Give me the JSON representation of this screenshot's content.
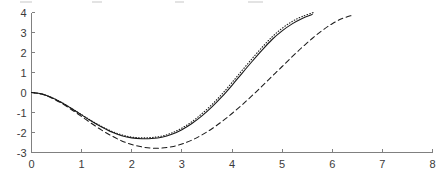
{
  "chart_data": {
    "type": "line",
    "title": "",
    "xlabel": "",
    "ylabel": "",
    "xlim": [
      0,
      8
    ],
    "ylim": [
      -3,
      4
    ],
    "xticks": [
      "0",
      "1",
      "2",
      "3",
      "4",
      "5",
      "6",
      "7",
      "8"
    ],
    "yticks": [
      "-3",
      "-2",
      "-1",
      "0",
      "1",
      "2",
      "3",
      "4"
    ],
    "grid": false,
    "legend": "none",
    "axis_color": "#808080",
    "line_color": "#1a1a1a",
    "series": [
      {
        "name": "solid",
        "style": "solid",
        "x": [
          0.0,
          0.2,
          0.4,
          0.6,
          0.8,
          1.0,
          1.2,
          1.4,
          1.6,
          1.8,
          2.0,
          2.2,
          2.4,
          2.6,
          2.8,
          3.0,
          3.2,
          3.4,
          3.6,
          3.8,
          4.0,
          4.2,
          4.4,
          4.6,
          4.8,
          5.0,
          5.2,
          5.4,
          5.6
        ],
        "y": [
          0.0,
          -0.07,
          -0.25,
          -0.5,
          -0.8,
          -1.12,
          -1.44,
          -1.73,
          -1.98,
          -2.16,
          -2.27,
          -2.31,
          -2.3,
          -2.24,
          -2.09,
          -1.86,
          -1.55,
          -1.17,
          -0.72,
          -0.21,
          0.36,
          0.96,
          1.55,
          2.12,
          2.65,
          3.08,
          3.43,
          3.7,
          3.9
        ]
      },
      {
        "name": "dotted",
        "style": "dotted",
        "x": [
          0.0,
          0.2,
          0.4,
          0.6,
          0.8,
          1.0,
          1.2,
          1.4,
          1.6,
          1.8,
          2.0,
          2.2,
          2.4,
          2.6,
          2.8,
          3.0,
          3.2,
          3.4,
          3.6,
          3.8,
          4.0,
          4.2,
          4.4,
          4.6,
          4.8,
          5.0,
          5.2,
          5.4,
          5.65
        ],
        "y": [
          0.0,
          -0.07,
          -0.25,
          -0.5,
          -0.8,
          -1.11,
          -1.42,
          -1.7,
          -1.94,
          -2.12,
          -2.23,
          -2.27,
          -2.25,
          -2.18,
          -2.02,
          -1.78,
          -1.46,
          -1.06,
          -0.6,
          -0.08,
          0.5,
          1.1,
          1.69,
          2.26,
          2.78,
          3.21,
          3.55,
          3.8,
          4.02
        ]
      },
      {
        "name": "dashed",
        "style": "dashed",
        "x": [
          0.0,
          0.2,
          0.4,
          0.6,
          0.8,
          1.0,
          1.2,
          1.4,
          1.6,
          1.8,
          2.0,
          2.2,
          2.4,
          2.6,
          2.8,
          3.0,
          3.2,
          3.4,
          3.6,
          3.8,
          4.0,
          4.2,
          4.4,
          4.6,
          4.8,
          5.0,
          5.2,
          5.4,
          5.6,
          5.8,
          6.0,
          6.2,
          6.4
        ],
        "y": [
          0.0,
          -0.08,
          -0.27,
          -0.54,
          -0.86,
          -1.2,
          -1.55,
          -1.88,
          -2.17,
          -2.42,
          -2.6,
          -2.72,
          -2.78,
          -2.78,
          -2.71,
          -2.58,
          -2.38,
          -2.12,
          -1.81,
          -1.45,
          -1.05,
          -0.62,
          -0.16,
          0.32,
          0.81,
          1.3,
          1.79,
          2.26,
          2.7,
          3.1,
          3.44,
          3.7,
          3.86
        ]
      }
    ]
  },
  "artifacts": {
    "smudges": [
      {
        "left": 20,
        "width": 12
      },
      {
        "left": 92,
        "width": 10
      },
      {
        "left": 175,
        "width": 9
      },
      {
        "left": 248,
        "width": 11
      },
      {
        "left": 258,
        "width": 5
      }
    ]
  }
}
